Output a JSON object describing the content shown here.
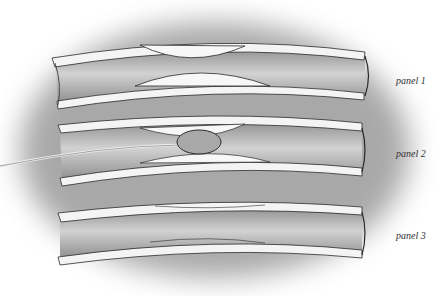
{
  "figure": {
    "panels": [
      {
        "label": "panel 1",
        "state": "plaque narrowing"
      },
      {
        "label": "panel 2",
        "state": "balloon catheter inflated"
      },
      {
        "label": "panel 3",
        "state": "lumen restored"
      }
    ]
  },
  "colors": {
    "background": "#ffffff",
    "shadow": "#9a9a9a",
    "vessel_wall": "#f4f4f4",
    "lumen": "#bdbdbd",
    "plaque": "#f7f7f7",
    "balloon": "#a8a8a8",
    "outline": "#2a2a2a"
  }
}
